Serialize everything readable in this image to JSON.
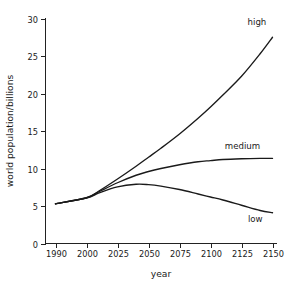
{
  "chart_data": {
    "type": "line",
    "title": "",
    "xlabel": "year",
    "ylabel": "world population/billions",
    "xlim": [
      1990,
      2150
    ],
    "ylim": [
      0,
      30
    ],
    "grid": false,
    "legend_position": "inline-end-labels",
    "x_tick_labels": [
      "1990",
      "2000",
      "2025",
      "2050",
      "2075",
      "2100",
      "2125",
      "2150"
    ],
    "x_tick_values": [
      1990,
      2000,
      2025,
      2050,
      2075,
      2100,
      2125,
      2150
    ],
    "y_tick_labels": [
      "0",
      "5",
      "10",
      "15",
      "20",
      "25",
      "30"
    ],
    "y_tick_values": [
      0,
      5,
      10,
      15,
      20,
      25,
      30
    ],
    "x": [
      1990,
      2000,
      2010,
      2025,
      2040,
      2050,
      2060,
      2075,
      2090,
      2100,
      2110,
      2125,
      2140,
      2150
    ],
    "series": [
      {
        "name": "high",
        "label": "high",
        "color": "#1a1a1a",
        "values": [
          5.3,
          6.1,
          7.0,
          8.6,
          10.3,
          11.5,
          12.7,
          14.6,
          16.7,
          18.2,
          19.8,
          22.3,
          25.3,
          27.5
        ]
      },
      {
        "name": "medium",
        "label": "medium",
        "color": "#1a1a1a",
        "values": [
          5.3,
          6.1,
          6.9,
          8.1,
          9.1,
          9.6,
          10.0,
          10.5,
          10.9,
          11.05,
          11.2,
          11.3,
          11.35,
          11.35
        ]
      },
      {
        "name": "low",
        "label": "low",
        "color": "#1a1a1a",
        "values": [
          5.3,
          6.05,
          6.75,
          7.55,
          7.9,
          7.85,
          7.65,
          7.2,
          6.6,
          6.2,
          5.8,
          5.1,
          4.4,
          4.1
        ]
      }
    ],
    "annotations": [
      {
        "text": "high",
        "x": 2145,
        "y": 29.2
      },
      {
        "text": "medium",
        "x": 2140,
        "y": 12.6
      },
      {
        "text": "low",
        "x": 2142,
        "y": 2.9
      }
    ]
  }
}
